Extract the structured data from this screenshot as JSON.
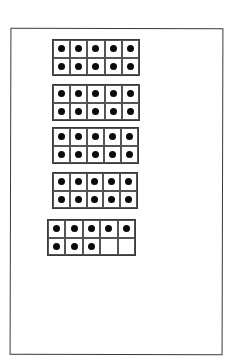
{
  "diagram": {
    "type": "ten-frames",
    "colors": {
      "border": "#3a3a3a",
      "grid_line": "#555555",
      "counter": "#0a0a0a",
      "background": "#ffffff"
    },
    "frames": [
      {
        "filled": 10,
        "left": 52,
        "top": 39,
        "width": 88,
        "height": 37
      },
      {
        "filled": 10,
        "left": 52,
        "top": 84,
        "width": 88,
        "height": 37
      },
      {
        "filled": 10,
        "left": 52,
        "top": 127,
        "width": 87,
        "height": 37
      },
      {
        "filled": 10,
        "left": 52,
        "top": 172,
        "width": 86,
        "height": 37
      },
      {
        "filled": 8,
        "left": 47,
        "top": 219,
        "width": 89,
        "height": 37
      }
    ],
    "total_counters": 48
  }
}
